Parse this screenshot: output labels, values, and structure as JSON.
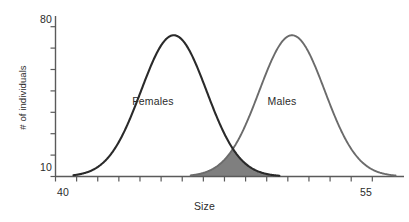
{
  "chart_data": {
    "type": "line",
    "title": "",
    "subtitle": "",
    "xlabel": "Size",
    "ylabel": "# of individuals",
    "xlim": [
      40,
      56.5
    ],
    "ylim": [
      10,
      85
    ],
    "xticks": [
      40,
      41,
      42,
      43,
      44,
      45,
      46,
      47,
      48,
      49,
      50,
      51,
      52,
      53,
      54,
      55
    ],
    "xtick_labels_shown": [
      "40",
      "55"
    ],
    "yticks": [
      10,
      20,
      30,
      40,
      50,
      60,
      70,
      80
    ],
    "ytick_labels_shown": [
      "80",
      "10"
    ],
    "grid": false,
    "legend": "inline-annotations",
    "annotations": [
      {
        "text": "Females",
        "x": 45.0,
        "y": 45
      },
      {
        "text": "Males",
        "x": 50.6,
        "y": 45
      }
    ],
    "series": [
      {
        "name": "Females",
        "kind": "normal-distribution",
        "color": "#2a2a2a",
        "mean": 45.6,
        "sigma": 1.55,
        "peak_value": 76,
        "baseline_value": 10,
        "x_start": 40.85,
        "x_end": 50.6
      },
      {
        "name": "Males",
        "kind": "normal-distribution",
        "color": "#6b6b6b",
        "mean": 51.2,
        "sigma": 1.55,
        "peak_value": 76,
        "baseline_value": 10,
        "x_start": 46.4,
        "x_end": 56.1
      }
    ],
    "overlap_region": {
      "label": "overlap",
      "fill_color": "#7f7f7f",
      "x_start": 46.4,
      "x_end": 50.6,
      "intersection_x": 48.4,
      "intersection_y": 25
    }
  },
  "axes": {
    "y_title": "# of individuals",
    "y_tick_top": "80",
    "y_tick_bottom": "10",
    "x_title": "Size",
    "x_tick_left": "40",
    "x_tick_right": "55"
  },
  "annotations": {
    "females": "Females",
    "males": "Males"
  },
  "colors": {
    "females_curve": "#2a2a2a",
    "males_curve": "#6b6b6b",
    "overlap_fill": "#7f7f7f",
    "axis": "#5a5a5a",
    "text": "#2b2b2b",
    "background": "#ffffff"
  }
}
